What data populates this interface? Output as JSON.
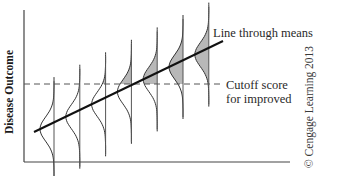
{
  "figure": {
    "type": "regression-distribution-diagram",
    "y_axis_label": "Disease Outcome",
    "annotations": {
      "regression_line": "Line through means",
      "cutoff_line_1": "Cutoff score",
      "cutoff_line_2": "for improved"
    },
    "copyright": "© Cengage Learning 2013",
    "colors": {
      "axis": "#444444",
      "regression_line": "#111111",
      "cutoff_line": "#555555",
      "curve": "#333333",
      "shading": "#b8b8b8"
    },
    "distributions_count": 7
  }
}
